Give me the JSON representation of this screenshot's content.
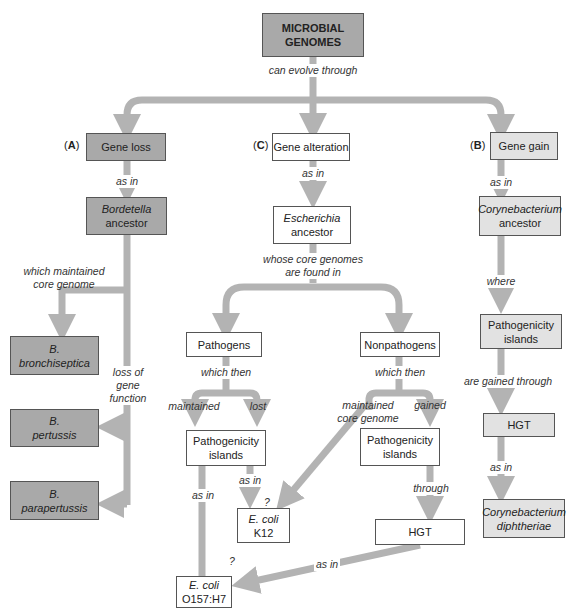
{
  "colors": {
    "dark_box": "#a9a9a9",
    "light_box": "#e2e2e2",
    "white_box": "#ffffff",
    "arrow": "#b3b3b3",
    "border": "#555555"
  },
  "root": {
    "line1": "MICROBIAL",
    "line2": "GENOMES"
  },
  "root_link": "can evolve through",
  "branch_a": {
    "tag": "A",
    "title": "Gene loss",
    "link1": "as in",
    "ancestor": {
      "line1": "Bordetella",
      "line2": "ancestor"
    },
    "link_maintained": {
      "line1": "which maintained",
      "line2": "core genome"
    },
    "link_loss": {
      "line1": "loss of",
      "line2": "gene",
      "line3": "function"
    },
    "species": [
      {
        "line1": "B.",
        "line2": "bronchiseptica"
      },
      {
        "line1": "B.",
        "line2": "pertussis"
      },
      {
        "line1": "B.",
        "line2": "parapertussis"
      }
    ]
  },
  "branch_c": {
    "tag": "C",
    "title": "Gene alteration",
    "link1": "as in",
    "ancestor": {
      "line1": "Escherichia",
      "line2": "ancestor"
    },
    "link2": {
      "line1": "whose core genomes",
      "line2": "are found in"
    },
    "pathogens": {
      "title": "Pathogens",
      "link": "which then",
      "maintained": "maintained",
      "lost": "lost",
      "islands": {
        "line1": "Pathogenicity",
        "line2": "islands"
      },
      "as_in_left": "as in",
      "as_in_right": "as in"
    },
    "nonpathogens": {
      "title": "Nonpathogens",
      "link": "which then",
      "maintained": {
        "line1": "maintained",
        "line2": "core genome"
      },
      "gained": "gained",
      "islands": {
        "line1": "Pathogenicity",
        "line2": "islands"
      },
      "through": "through",
      "hgt": "HGT",
      "as_in": "as in"
    },
    "k12": {
      "line1": "E. coli",
      "line2": "K12",
      "question": "?"
    },
    "o157": {
      "line1": "E. coli",
      "line2": "O157:H7",
      "question": "?"
    }
  },
  "branch_b": {
    "tag": "B",
    "title": "Gene gain",
    "link1": "as in",
    "ancestor": {
      "line1": "Corynebacterium",
      "line2": "ancestor"
    },
    "link2": "where",
    "islands": {
      "line1": "Pathogenicity",
      "line2": "islands"
    },
    "link3": "are gained through",
    "hgt": "HGT",
    "link4": "as in",
    "species": {
      "line1": "Corynebacterium",
      "line2": "diphtheriae"
    }
  }
}
